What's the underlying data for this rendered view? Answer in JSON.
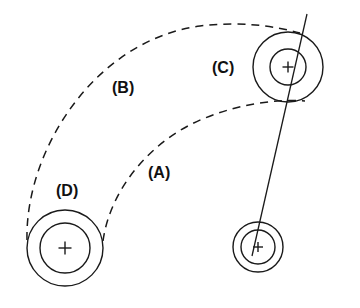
{
  "diagram": {
    "background_color": "#ffffff",
    "stroke_color": "#1a1a1a",
    "width": 360,
    "height": 308
  },
  "labels": {
    "a": "(A)",
    "b": "(B)",
    "c": "(C)",
    "d": "(D)"
  },
  "label_positions": {
    "a": {
      "x": 148,
      "y": 178
    },
    "b": {
      "x": 112,
      "y": 93
    },
    "c": {
      "x": 212,
      "y": 73
    },
    "d": {
      "x": 56,
      "y": 196
    }
  },
  "pulleys": [
    {
      "name": "pulley-c",
      "label": "(C)",
      "center_x": 288,
      "center_y": 67,
      "outer_radius": 35,
      "inner_radius": 18,
      "crosshair_size": 11
    },
    {
      "name": "pulley-d",
      "label": "(D)",
      "center_x": 65,
      "center_y": 248,
      "outer_radius": 38,
      "inner_radius": 25,
      "crosshair_size": 13
    },
    {
      "name": "pulley-small-lower",
      "label": "",
      "center_x": 258,
      "center_y": 247,
      "outer_radius": 25,
      "inner_radius": 17,
      "crosshair_size": 10
    }
  ],
  "belt_paths": [
    {
      "name": "belt-path-b",
      "label": "(B)",
      "style": "dashed",
      "description": "Upper dashed arc from pulley D left side sweeping up to pulley C top",
      "path": "M 27,240 C 25,150 95,40 200,26 C 240,21 275,26 300,33"
    },
    {
      "name": "belt-path-a",
      "label": "(A)",
      "style": "dashed",
      "description": "Lower dashed arc from pulley D right side sweeping up to pulley C lower left",
      "path": "M 103,241 C 110,190 150,140 205,118 C 240,104 275,99 305,101"
    }
  ],
  "connector": {
    "name": "center-link-line",
    "style": "solid",
    "description": "Straight solid line passing through pulley C center down to the small lower pulley center",
    "x1": 307,
    "y1": 14,
    "x2": 252,
    "y2": 256
  },
  "legend_note": {
    "visible": false,
    "text": ""
  }
}
